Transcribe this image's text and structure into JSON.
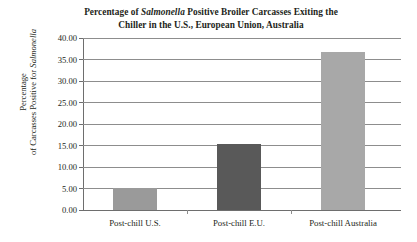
{
  "chart_data": {
    "type": "bar",
    "title": "Percentage of Salmonella Positive Broiler Carcasses Exiting the Chiller in the U.S., European Union, Australia",
    "title_line1_pre": "Percentage of ",
    "title_line1_italic": "Salmonella",
    "title_line1_post": " Positive Broiler Carcasses Exiting the",
    "title_line2": "Chiller in the U.S., European Union, Australia",
    "xlabel": "",
    "ylabel": "Percentage of Carcasses Positive for Salmonella",
    "ylabel_line1": "Percentage",
    "ylabel_line2_pre": "of Carcasses Positive for ",
    "ylabel_line2_italic": "Salmonella",
    "categories": [
      "Post-chill U.S.",
      "Post-chill E.U.",
      "Post-chill Australia"
    ],
    "values": [
      5.2,
      15.4,
      36.7
    ],
    "ylim": [
      0,
      40
    ],
    "ytick_step": 5,
    "ytick_labels": [
      "0.00",
      "5.00",
      "10.00",
      "15.00",
      "20.00",
      "25.00",
      "30.00",
      "35.00",
      "40.00"
    ],
    "ytick_values": [
      0,
      5,
      10,
      15,
      20,
      25,
      30,
      35,
      40
    ],
    "grid": true,
    "legend": false,
    "bar_colors": [
      "#9a9a9a",
      "#595959",
      "#a8a8a8"
    ],
    "grid_color": "#8d8d8d",
    "axis_color": "#6e6e6e",
    "text_color": "#231f20"
  }
}
